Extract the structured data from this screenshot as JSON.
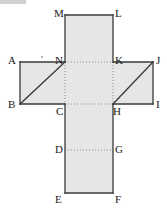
{
  "figure": {
    "name": "cube-net-cross-diagram",
    "canvas": {
      "width": 167,
      "height": 213
    },
    "style": {
      "fill": "#e6e6e6",
      "stroke": "#3a3a3a",
      "dotted_stroke": "#8c8c8c",
      "label_color": "#1a1a1a",
      "background": "#ffffff",
      "stroke_width": 1.3,
      "dotted_width": 1,
      "dash_pattern": "1,2"
    },
    "outline_path": "M 65 15 L 113 15 L 113 62 L 153 62 L 153 104 L 113 104 L 113 193 L 65 193 L 65 104 L 20 104 L 20 62 L 65 62 Z",
    "points": [
      {
        "id": "M",
        "label": "M",
        "x": 65,
        "y": 15,
        "label_x": 54,
        "label_y": 8
      },
      {
        "id": "L",
        "label": "L",
        "x": 113,
        "y": 15,
        "label_x": 115,
        "label_y": 8
      },
      {
        "id": "A",
        "label": "A",
        "x": 20,
        "y": 62,
        "label_x": 8,
        "label_y": 55
      },
      {
        "id": "N",
        "label": "N",
        "x": 65,
        "y": 62,
        "label_x": 55,
        "label_y": 55
      },
      {
        "id": "K",
        "label": "K",
        "x": 113,
        "y": 62,
        "label_x": 115,
        "label_y": 55
      },
      {
        "id": "J",
        "label": "J",
        "x": 153,
        "y": 62,
        "label_x": 156,
        "label_y": 55
      },
      {
        "id": "B",
        "label": "B",
        "x": 20,
        "y": 104,
        "label_x": 8,
        "label_y": 99
      },
      {
        "id": "C",
        "label": "C",
        "x": 65,
        "y": 104,
        "label_x": 56,
        "label_y": 106
      },
      {
        "id": "H",
        "label": "H",
        "x": 113,
        "y": 104,
        "label_x": 113,
        "label_y": 106
      },
      {
        "id": "I",
        "label": "I",
        "x": 153,
        "y": 104,
        "label_x": 156,
        "label_y": 99
      },
      {
        "id": "D",
        "label": "D",
        "x": 65,
        "y": 150,
        "label_x": 55,
        "label_y": 144
      },
      {
        "id": "G",
        "label": "G",
        "x": 113,
        "y": 150,
        "label_x": 115,
        "label_y": 144
      },
      {
        "id": "E",
        "label": "E",
        "x": 65,
        "y": 193,
        "label_x": 55,
        "label_y": 194
      },
      {
        "id": "F",
        "label": "F",
        "x": 113,
        "y": 193,
        "label_x": 115,
        "label_y": 194
      }
    ],
    "solid_segments": [
      {
        "name": "segment-M-L",
        "from": "M",
        "to": "L",
        "x1": 65,
        "y1": 15,
        "x2": 113,
        "y2": 15
      },
      {
        "name": "segment-L-K",
        "from": "L",
        "to": "K",
        "x1": 113,
        "y1": 15,
        "x2": 113,
        "y2": 62
      },
      {
        "name": "segment-K-J",
        "from": "K",
        "to": "J",
        "x1": 113,
        "y1": 62,
        "x2": 153,
        "y2": 62
      },
      {
        "name": "segment-J-I",
        "from": "J",
        "to": "I",
        "x1": 153,
        "y1": 62,
        "x2": 153,
        "y2": 104
      },
      {
        "name": "segment-I-H",
        "from": "I",
        "to": "H",
        "x1": 153,
        "y1": 104,
        "x2": 113,
        "y2": 104
      },
      {
        "name": "segment-H-F",
        "from": "H",
        "to": "F",
        "x1": 113,
        "y1": 104,
        "x2": 113,
        "y2": 193
      },
      {
        "name": "segment-F-E",
        "from": "F",
        "to": "E",
        "x1": 113,
        "y1": 193,
        "x2": 65,
        "y2": 193
      },
      {
        "name": "segment-E-C",
        "from": "E",
        "to": "C",
        "x1": 65,
        "y1": 193,
        "x2": 65,
        "y2": 104
      },
      {
        "name": "segment-C-B",
        "from": "C",
        "to": "B",
        "x1": 65,
        "y1": 104,
        "x2": 20,
        "y2": 104
      },
      {
        "name": "segment-B-A",
        "from": "B",
        "to": "A",
        "x1": 20,
        "y1": 104,
        "x2": 20,
        "y2": 62
      },
      {
        "name": "segment-A-N",
        "from": "A",
        "to": "N",
        "x1": 20,
        "y1": 62,
        "x2": 65,
        "y2": 62
      },
      {
        "name": "segment-N-M",
        "from": "N",
        "to": "M",
        "x1": 65,
        "y1": 62,
        "x2": 65,
        "y2": 15
      }
    ],
    "diagonals": [
      {
        "name": "diagonal-B-N",
        "from": "B",
        "to": "N",
        "x1": 20,
        "y1": 104,
        "x2": 65,
        "y2": 62
      },
      {
        "name": "diagonal-H-J",
        "from": "H",
        "to": "J",
        "x1": 113,
        "y1": 104,
        "x2": 153,
        "y2": 62
      }
    ],
    "dotted_segments": [
      {
        "name": "dotted-N-K",
        "from": "N",
        "to": "K",
        "x1": 65,
        "y1": 62,
        "x2": 113,
        "y2": 62
      },
      {
        "name": "dotted-C-H",
        "from": "C",
        "to": "H",
        "x1": 65,
        "y1": 104,
        "x2": 113,
        "y2": 104
      },
      {
        "name": "dotted-D-G",
        "from": "D",
        "to": "G",
        "x1": 65,
        "y1": 150,
        "x2": 113,
        "y2": 150
      },
      {
        "name": "dotted-N-C",
        "from": "N",
        "to": "C",
        "x1": 65,
        "y1": 62,
        "x2": 65,
        "y2": 104
      },
      {
        "name": "dotted-K-H",
        "from": "K",
        "to": "H",
        "x1": 113,
        "y1": 62,
        "x2": 113,
        "y2": 104
      }
    ],
    "artifacts": [
      {
        "name": "scan-speck",
        "x": 41,
        "y": 56
      }
    ]
  }
}
